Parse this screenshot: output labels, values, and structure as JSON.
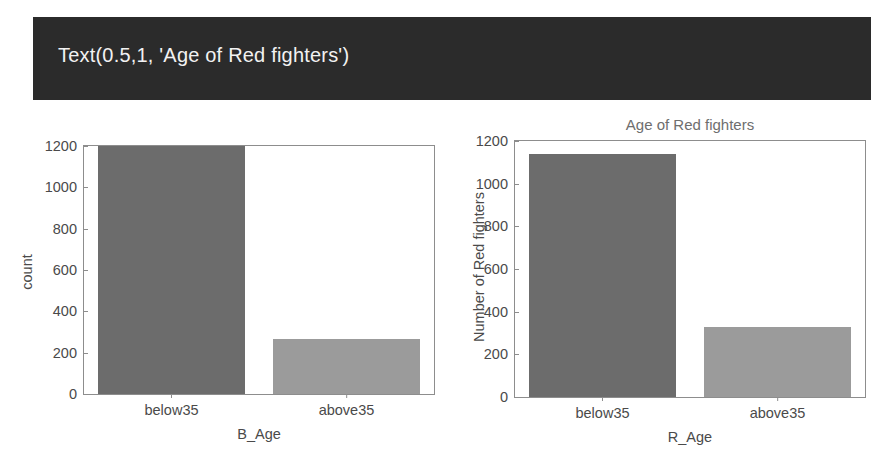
{
  "banner": {
    "text": "Text(0.5,1, 'Age of Red fighters')",
    "background_color": "#2b2b2b",
    "text_color": "#f2f2f2"
  },
  "colors": {
    "bar_dark": "#6c6c6c",
    "bar_light": "#9b9b9b",
    "axis": "#8d8d8d",
    "tick_text": "#4a4a4a",
    "title_text": "#6e6e6e",
    "page_background": "#ffffff"
  },
  "chart_data": [
    {
      "type": "bar",
      "title": "",
      "xlabel": "B_Age",
      "ylabel": "count",
      "categories": [
        "below35",
        "above35"
      ],
      "values": [
        1200,
        265
      ],
      "ylim": [
        0,
        1200
      ],
      "yticks": [
        0,
        200,
        400,
        600,
        800,
        1000,
        1200
      ],
      "yticklabels": [
        "0",
        "200",
        "400",
        "600",
        "800",
        "1000",
        "1200"
      ],
      "bar_colors": [
        "#6c6c6c",
        "#9b9b9b"
      ],
      "grid": false,
      "legend": "none"
    },
    {
      "type": "bar",
      "title": "Age of Red fighters",
      "xlabel": "R_Age",
      "ylabel": "Number of Red fighters",
      "categories": [
        "below35",
        "above35"
      ],
      "values": [
        1140,
        327
      ],
      "ylim": [
        0,
        1200
      ],
      "yticks": [
        0,
        200,
        400,
        600,
        800,
        1000,
        1200
      ],
      "yticklabels": [
        "0",
        "200",
        "400",
        "600",
        "800",
        "1000",
        "1200"
      ],
      "bar_colors": [
        "#6c6c6c",
        "#9b9b9b"
      ],
      "grid": false,
      "legend": "none"
    }
  ]
}
